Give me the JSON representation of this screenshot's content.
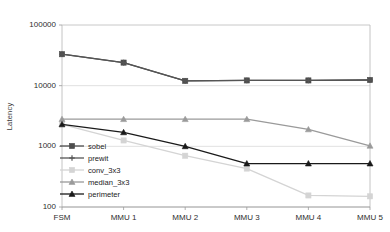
{
  "chart_data": {
    "type": "line",
    "title": "",
    "xlabel": "",
    "ylabel": "Latency",
    "categories": [
      "FSM",
      "MMU 1",
      "MMU 2",
      "MMU 3",
      "MMU 4",
      "MMU 5"
    ],
    "yscale": "log",
    "ylim": [
      100,
      100000
    ],
    "yticks": [
      100,
      1000,
      10000,
      100000
    ],
    "ytick_labels": [
      "100",
      "1000",
      "10000",
      "100000"
    ],
    "grid": true,
    "legend_position": "inside-lower-left",
    "series": [
      {
        "name": "sobel",
        "color": "#4d4d4d",
        "marker": "square",
        "values": [
          33000,
          24000,
          12000,
          12200,
          12200,
          12400
        ]
      },
      {
        "name": "prewit",
        "color": "#555555",
        "marker": "plus",
        "values": [
          33000,
          24000,
          12000,
          12200,
          12200,
          12400
        ]
      },
      {
        "name": "conv_3x3",
        "color": "#d4d4d4",
        "marker": "square",
        "values": [
          2300,
          1250,
          700,
          430,
          155,
          150
        ]
      },
      {
        "name": "median_3x3",
        "color": "#9a9a9a",
        "marker": "triangle",
        "values": [
          2800,
          2800,
          2800,
          2800,
          1900,
          1020
        ]
      },
      {
        "name": "perimeter",
        "color": "#1a1a1a",
        "marker": "triangle",
        "values": [
          2300,
          1700,
          1000,
          520,
          520,
          520
        ]
      }
    ]
  },
  "axis": {
    "y_title": "Latency"
  },
  "legend": {
    "items": [
      {
        "label": "sobel"
      },
      {
        "label": "prewit"
      },
      {
        "label": "conv_3x3"
      },
      {
        "label": "median_3x3"
      },
      {
        "label": "perimeter"
      }
    ]
  }
}
